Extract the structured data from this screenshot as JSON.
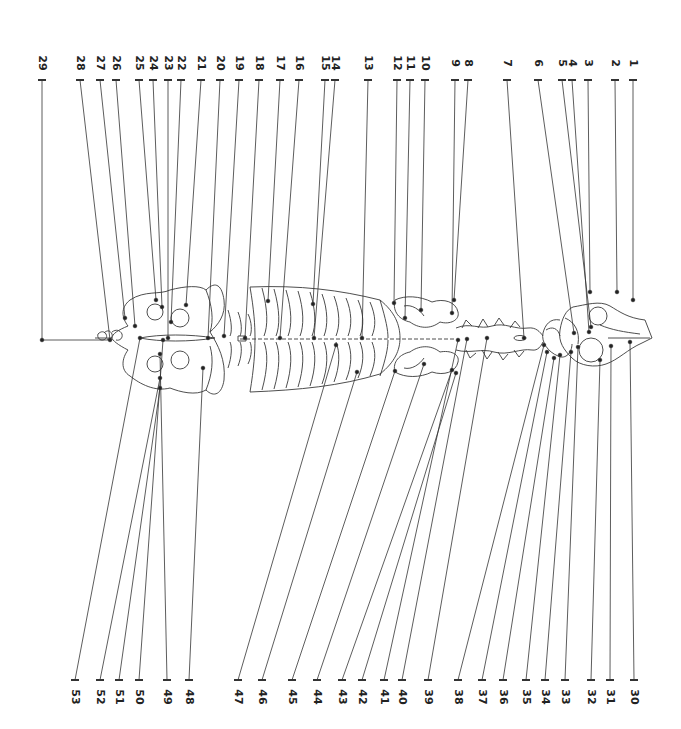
{
  "diagram": {
    "type": "labeled anatomical skeleton (dorsal view, rotated)",
    "line_color": "#333333",
    "background": "#ffffff",
    "top_labels": [
      {
        "n": "1",
        "x": 633,
        "tx": 633,
        "ty": 300
      },
      {
        "n": "2",
        "x": 615,
        "tx": 617,
        "ty": 292
      },
      {
        "n": "3",
        "x": 588,
        "tx": 590,
        "ty": 292
      },
      {
        "n": "4",
        "x": 572,
        "tx": 589,
        "ty": 332
      },
      {
        "n": "5",
        "x": 562,
        "tx": 591,
        "ty": 327
      },
      {
        "n": "6",
        "x": 538,
        "tx": 574,
        "ty": 333
      },
      {
        "n": "7",
        "x": 507,
        "tx": 524,
        "ty": 338
      },
      {
        "n": "8",
        "x": 468,
        "tx": 454,
        "ty": 300
      },
      {
        "n": "9",
        "x": 455,
        "tx": 452,
        "ty": 313
      },
      {
        "n": "10",
        "x": 425,
        "tx": 421,
        "ty": 310
      },
      {
        "n": "11",
        "x": 410,
        "tx": 405,
        "ty": 318
      },
      {
        "n": "12",
        "x": 397,
        "tx": 394,
        "ty": 303
      },
      {
        "n": "13",
        "x": 368,
        "tx": 362,
        "ty": 338
      },
      {
        "n": "14",
        "x": 335,
        "tx": 314,
        "ty": 338
      },
      {
        "n": "15",
        "x": 325,
        "tx": 313,
        "ty": 304
      },
      {
        "n": "16",
        "x": 299,
        "tx": 280,
        "ty": 338
      },
      {
        "n": "17",
        "x": 280,
        "tx": 268,
        "ty": 301
      },
      {
        "n": "18",
        "x": 259,
        "tx": 245,
        "ty": 338
      },
      {
        "n": "19",
        "x": 239,
        "tx": 224,
        "ty": 336
      },
      {
        "n": "20",
        "x": 220,
        "tx": 208,
        "ty": 338
      },
      {
        "n": "21",
        "x": 201,
        "tx": 186,
        "ty": 305
      },
      {
        "n": "22",
        "x": 181,
        "tx": 171,
        "ty": 322
      },
      {
        "n": "23",
        "x": 168,
        "tx": 168,
        "ty": 338
      },
      {
        "n": "24",
        "x": 153,
        "tx": 162,
        "ty": 307
      },
      {
        "n": "25",
        "x": 139,
        "tx": 156,
        "ty": 300
      },
      {
        "n": "26",
        "x": 116,
        "tx": 135,
        "ty": 326
      },
      {
        "n": "27",
        "x": 100,
        "tx": 125,
        "ty": 318
      },
      {
        "n": "28",
        "x": 80,
        "tx": 110,
        "ty": 340
      },
      {
        "n": "29",
        "x": 42,
        "tx": 112,
        "ty": 340
      }
    ],
    "bottom_labels": [
      {
        "n": "30",
        "x": 634,
        "tx": 630,
        "ty": 342
      },
      {
        "n": "31",
        "x": 610,
        "tx": 611,
        "ty": 346
      },
      {
        "n": "32",
        "x": 591,
        "tx": 600,
        "ty": 360
      },
      {
        "n": "33",
        "x": 565,
        "tx": 578,
        "ty": 347
      },
      {
        "n": "34",
        "x": 545,
        "tx": 571,
        "ty": 352
      },
      {
        "n": "35",
        "x": 526,
        "tx": 560,
        "ty": 355
      },
      {
        "n": "36",
        "x": 503,
        "tx": 554,
        "ty": 358
      },
      {
        "n": "37",
        "x": 482,
        "tx": 547,
        "ty": 352
      },
      {
        "n": "38",
        "x": 458,
        "tx": 544,
        "ty": 345
      },
      {
        "n": "39",
        "x": 428,
        "tx": 487,
        "ty": 338
      },
      {
        "n": "40",
        "x": 402,
        "tx": 467,
        "ty": 339
      },
      {
        "n": "41",
        "x": 384,
        "tx": 458,
        "ty": 340
      },
      {
        "n": "42",
        "x": 362,
        "tx": 456,
        "ty": 373
      },
      {
        "n": "43",
        "x": 342,
        "tx": 452,
        "ty": 370
      },
      {
        "n": "44",
        "x": 317,
        "tx": 424,
        "ty": 364
      },
      {
        "n": "45",
        "x": 292,
        "tx": 395,
        "ty": 371
      },
      {
        "n": "46",
        "x": 262,
        "tx": 357,
        "ty": 372
      },
      {
        "n": "47",
        "x": 238,
        "tx": 336,
        "ty": 345
      },
      {
        "n": "48",
        "x": 189,
        "tx": 203,
        "ty": 368
      },
      {
        "n": "49",
        "x": 167,
        "tx": 160,
        "ty": 354
      },
      {
        "n": "50",
        "x": 139,
        "tx": 163,
        "ty": 340
      },
      {
        "n": "51",
        "x": 119,
        "tx": 160,
        "ty": 388
      },
      {
        "n": "52",
        "x": 100,
        "tx": 160,
        "ty": 378
      },
      {
        "n": "53",
        "x": 75,
        "tx": 140,
        "ty": 338
      }
    ],
    "top_tick_y": 80,
    "bottom_tick_y": 680
  }
}
